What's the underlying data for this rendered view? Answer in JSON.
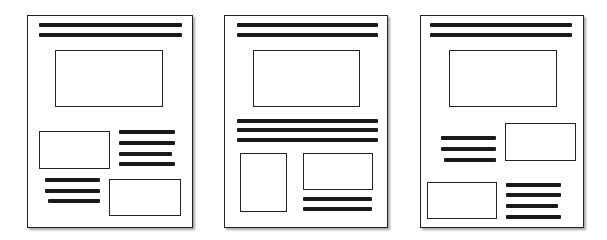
{
  "diagram": {
    "style": {
      "border_color": "#222222",
      "line_color": "#1a1a1a",
      "background": "#ffffff"
    },
    "pages": [
      {
        "name": "layout-1",
        "frame": {
          "x": 27,
          "y": 15,
          "w": 166,
          "h": 213
        },
        "elements": [
          {
            "type": "line",
            "x": 39,
            "y": 23,
            "w": 143
          },
          {
            "type": "line",
            "x": 39,
            "y": 33,
            "w": 143
          },
          {
            "type": "box",
            "x": 55,
            "y": 50,
            "w": 108,
            "h": 57
          },
          {
            "type": "box",
            "x": 39,
            "y": 131,
            "w": 71,
            "h": 38
          },
          {
            "type": "line",
            "x": 119,
            "y": 130,
            "w": 56
          },
          {
            "type": "line",
            "x": 119,
            "y": 141,
            "w": 56
          },
          {
            "type": "line",
            "x": 119,
            "y": 152,
            "w": 53
          },
          {
            "type": "line",
            "x": 119,
            "y": 162,
            "w": 56
          },
          {
            "type": "line",
            "x": 45,
            "y": 178,
            "w": 55
          },
          {
            "type": "line",
            "x": 45,
            "y": 189,
            "w": 55
          },
          {
            "type": "line",
            "x": 48,
            "y": 199,
            "w": 52
          },
          {
            "type": "box",
            "x": 109,
            "y": 179,
            "w": 72,
            "h": 37
          }
        ]
      },
      {
        "name": "layout-2",
        "frame": {
          "x": 224,
          "y": 15,
          "w": 164,
          "h": 213
        },
        "elements": [
          {
            "type": "line",
            "x": 237,
            "y": 23,
            "w": 141
          },
          {
            "type": "line",
            "x": 237,
            "y": 33,
            "w": 141
          },
          {
            "type": "box",
            "x": 253,
            "y": 50,
            "w": 107,
            "h": 57
          },
          {
            "type": "line",
            "x": 237,
            "y": 119,
            "w": 141
          },
          {
            "type": "line",
            "x": 237,
            "y": 128,
            "w": 141
          },
          {
            "type": "line",
            "x": 237,
            "y": 138,
            "w": 141
          },
          {
            "type": "box",
            "x": 240,
            "y": 153,
            "w": 47,
            "h": 59
          },
          {
            "type": "box",
            "x": 303,
            "y": 153,
            "w": 70,
            "h": 37
          },
          {
            "type": "line",
            "x": 303,
            "y": 197,
            "w": 69
          },
          {
            "type": "line",
            "x": 303,
            "y": 207,
            "w": 69
          }
        ]
      },
      {
        "name": "layout-3",
        "frame": {
          "x": 420,
          "y": 15,
          "w": 164,
          "h": 213
        },
        "elements": [
          {
            "type": "line",
            "x": 430,
            "y": 23,
            "w": 142
          },
          {
            "type": "line",
            "x": 430,
            "y": 33,
            "w": 142
          },
          {
            "type": "box",
            "x": 449,
            "y": 50,
            "w": 108,
            "h": 57
          },
          {
            "type": "line",
            "x": 441,
            "y": 136,
            "w": 55
          },
          {
            "type": "line",
            "x": 441,
            "y": 147,
            "w": 55
          },
          {
            "type": "line",
            "x": 444,
            "y": 158,
            "w": 52
          },
          {
            "type": "box",
            "x": 505,
            "y": 123,
            "w": 71,
            "h": 38
          },
          {
            "type": "box",
            "x": 427,
            "y": 182,
            "w": 70,
            "h": 37
          },
          {
            "type": "line",
            "x": 506,
            "y": 183,
            "w": 55
          },
          {
            "type": "line",
            "x": 506,
            "y": 193,
            "w": 55
          },
          {
            "type": "line",
            "x": 506,
            "y": 204,
            "w": 52
          },
          {
            "type": "line",
            "x": 506,
            "y": 215,
            "w": 55
          }
        ]
      }
    ]
  }
}
